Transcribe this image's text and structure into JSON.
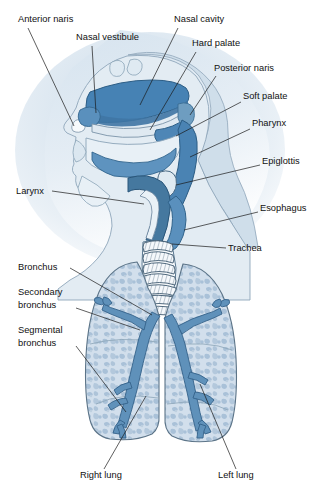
{
  "figure": {
    "background_color": "#ffffff",
    "palette": {
      "airway_dark": "#3f7fb0",
      "airway_mid": "#6e9dc0",
      "tissue_light": "#c3d6e6",
      "lung_fill": "#cfdced",
      "lung_mottle": "#a8c0d6",
      "outline": "#3a4a59",
      "leader_line": "#1a1a1a",
      "label_text": "#111111",
      "halo_top": "#dbe6f0",
      "halo_bottom": "#f2f6fa",
      "cartilage": "#f4f7fa"
    }
  },
  "labels": [
    {
      "id": "anterior-naris",
      "text": "Anterior naris",
      "x": 18,
      "y": 22,
      "anchor": "start",
      "lines": []
    },
    {
      "id": "nasal-vestibule",
      "text": "Nasal vestibule",
      "x": 76,
      "y": 40,
      "anchor": "start",
      "lines": []
    },
    {
      "id": "nasal-cavity",
      "text": "Nasal cavity",
      "x": 174,
      "y": 22,
      "anchor": "start",
      "lines": []
    },
    {
      "id": "hard-palate",
      "text": "Hard palate",
      "x": 192,
      "y": 46,
      "anchor": "start",
      "lines": []
    },
    {
      "id": "posterior-naris",
      "text": "Posterior naris",
      "x": 214,
      "y": 71,
      "anchor": "start",
      "lines": []
    },
    {
      "id": "soft-palate",
      "text": "Soft palate",
      "x": 243,
      "y": 99,
      "anchor": "start",
      "lines": []
    },
    {
      "id": "pharynx",
      "text": "Pharynx",
      "x": 252,
      "y": 126,
      "anchor": "start",
      "lines": []
    },
    {
      "id": "epiglottis",
      "text": "Epiglottis",
      "x": 262,
      "y": 164,
      "anchor": "start",
      "lines": []
    },
    {
      "id": "larynx",
      "text": "Larynx",
      "x": 16,
      "y": 194,
      "anchor": "start",
      "lines": []
    },
    {
      "id": "esophagus",
      "text": "Esophagus",
      "x": 260,
      "y": 211,
      "anchor": "start",
      "lines": []
    },
    {
      "id": "trachea",
      "text": "Trachea",
      "x": 228,
      "y": 251,
      "anchor": "start",
      "lines": []
    },
    {
      "id": "bronchus",
      "text": "Bronchus",
      "x": 18,
      "y": 270,
      "anchor": "start",
      "lines": []
    },
    {
      "id": "secondary-bronchus",
      "text": "Secondary",
      "x": 18,
      "y": 295,
      "anchor": "start",
      "lines": [
        "Secondary",
        "bronchus"
      ]
    },
    {
      "id": "segmental-bronchus",
      "text": "Segmental",
      "x": 18,
      "y": 333,
      "anchor": "start",
      "lines": [
        "Segmental",
        "bronchus"
      ]
    },
    {
      "id": "right-lung",
      "text": "Right lung",
      "x": 80,
      "y": 478,
      "anchor": "start",
      "lines": []
    },
    {
      "id": "left-lung",
      "text": "Left lung",
      "x": 218,
      "y": 478,
      "anchor": "start",
      "lines": []
    }
  ],
  "structures": [
    {
      "id": "nasal-cavity-region",
      "name": "Nasal cavity"
    },
    {
      "id": "nasal-vestibule-region",
      "name": "Nasal vestibule"
    },
    {
      "id": "anterior-naris-region",
      "name": "Anterior naris"
    },
    {
      "id": "hard-palate-region",
      "name": "Hard palate"
    },
    {
      "id": "soft-palate-region",
      "name": "Soft palate"
    },
    {
      "id": "posterior-naris-region",
      "name": "Posterior naris"
    },
    {
      "id": "pharynx-region",
      "name": "Pharynx"
    },
    {
      "id": "epiglottis-region",
      "name": "Epiglottis"
    },
    {
      "id": "larynx-region",
      "name": "Larynx"
    },
    {
      "id": "esophagus-region",
      "name": "Esophagus"
    },
    {
      "id": "trachea-region",
      "name": "Trachea"
    },
    {
      "id": "right-lung-region",
      "name": "Right lung"
    },
    {
      "id": "left-lung-region",
      "name": "Left lung"
    },
    {
      "id": "bronchial-tree-right",
      "name": "Right bronchial tree"
    },
    {
      "id": "bronchial-tree-left",
      "name": "Left bronchial tree"
    }
  ]
}
